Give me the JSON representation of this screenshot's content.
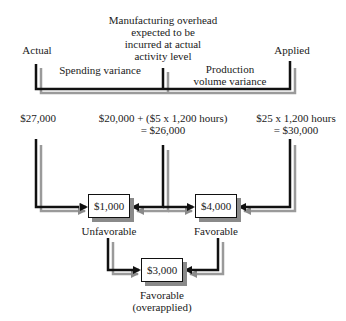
{
  "header": {
    "actual_label": "Actual",
    "expected_label": [
      "Manufacturing overhead",
      "expected to be",
      "incurred at actual",
      "activity level"
    ],
    "applied_label": "Applied",
    "spending_variance_label": "Spending variance",
    "production_volume_label": [
      "Production",
      "volume variance"
    ]
  },
  "amounts": {
    "actual": "$27,000",
    "expected": [
      "$20,000 + ($5 x 1,200 hours)",
      "= $26,000"
    ],
    "applied": [
      "$25 x 1,200 hours",
      "= $30,000"
    ]
  },
  "variances": {
    "spending": {
      "amount": "$1,000",
      "label": "Unfavorable"
    },
    "volume": {
      "amount": "$4,000",
      "label": "Favorable"
    },
    "total": {
      "amount": "$3,000",
      "label": [
        "Favorable",
        "(overapplied)"
      ]
    }
  },
  "colors": {
    "line": "#111111",
    "shadow": "#8a8a8a"
  }
}
